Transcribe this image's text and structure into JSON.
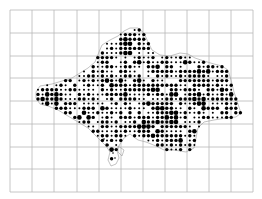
{
  "map": {
    "type": "dot-distribution-map",
    "background": "#ffffff",
    "grid": {
      "color": "#b8b8b8",
      "x_lines": [
        10,
        32,
        54,
        77,
        99,
        121,
        143,
        165,
        187,
        209,
        231,
        253
      ],
      "y_lines": [
        10,
        33,
        56,
        78,
        101,
        124,
        147,
        169,
        192
      ]
    },
    "outline": {
      "color": "#9a9a9a",
      "points": [
        [
          36,
          92
        ],
        [
          40,
          86
        ],
        [
          52,
          84
        ],
        [
          62,
          81
        ],
        [
          72,
          78
        ],
        [
          80,
          73
        ],
        [
          88,
          68
        ],
        [
          95,
          62
        ],
        [
          99,
          52
        ],
        [
          102,
          45
        ],
        [
          110,
          40
        ],
        [
          118,
          36
        ],
        [
          124,
          31
        ],
        [
          130,
          28
        ],
        [
          138,
          28
        ],
        [
          144,
          33
        ],
        [
          148,
          42
        ],
        [
          152,
          50
        ],
        [
          160,
          55
        ],
        [
          170,
          56
        ],
        [
          180,
          53
        ],
        [
          188,
          54
        ],
        [
          195,
          58
        ],
        [
          204,
          61
        ],
        [
          214,
          64
        ],
        [
          222,
          66
        ],
        [
          228,
          70
        ],
        [
          231,
          80
        ],
        [
          234,
          92
        ],
        [
          238,
          104
        ],
        [
          241,
          113
        ],
        [
          236,
          117
        ],
        [
          226,
          118
        ],
        [
          214,
          120
        ],
        [
          204,
          122
        ],
        [
          198,
          128
        ],
        [
          196,
          138
        ],
        [
          194,
          148
        ],
        [
          186,
          152
        ],
        [
          174,
          150
        ],
        [
          164,
          150
        ],
        [
          156,
          146
        ],
        [
          146,
          142
        ],
        [
          138,
          140
        ],
        [
          130,
          134
        ],
        [
          124,
          138
        ],
        [
          120,
          144
        ],
        [
          117,
          150
        ],
        [
          119,
          158
        ],
        [
          116,
          164
        ],
        [
          111,
          166
        ],
        [
          108,
          160
        ],
        [
          110,
          152
        ],
        [
          106,
          146
        ],
        [
          100,
          140
        ],
        [
          94,
          134
        ],
        [
          88,
          128
        ],
        [
          78,
          122
        ],
        [
          68,
          116
        ],
        [
          58,
          110
        ],
        [
          48,
          106
        ],
        [
          40,
          104
        ],
        [
          36,
          98
        ]
      ],
      "inlet": [
        [
          118,
          146
        ],
        [
          124,
          150
        ],
        [
          122,
          156
        ],
        [
          118,
          152
        ]
      ]
    },
    "dots": {
      "color": "#000000",
      "spacing": 4.6,
      "origin": [
        38,
        30
      ],
      "sizes": {
        "large": 2.3,
        "medium": 1.7,
        "small": 1.0
      },
      "dense_zones": [
        {
          "cx": 50,
          "cy": 96,
          "r": 14
        },
        {
          "cx": 128,
          "cy": 45,
          "r": 14
        },
        {
          "cx": 170,
          "cy": 110,
          "r": 20
        },
        {
          "cx": 150,
          "cy": 128,
          "r": 14
        },
        {
          "cx": 110,
          "cy": 85,
          "r": 12
        },
        {
          "cx": 88,
          "cy": 118,
          "r": 10
        },
        {
          "cx": 200,
          "cy": 100,
          "r": 12
        }
      ],
      "seed": 7
    }
  }
}
